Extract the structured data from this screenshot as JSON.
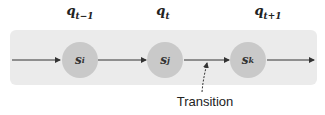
{
  "diagram": {
    "type": "state-sequence",
    "time_labels": [
      {
        "base": "q",
        "sub": "t−1"
      },
      {
        "base": "q",
        "sub": "t"
      },
      {
        "base": "q",
        "sub": "t+1"
      }
    ],
    "states": [
      {
        "base": "s",
        "sub": "i"
      },
      {
        "base": "s",
        "sub": "j"
      },
      {
        "base": "s",
        "sub": "k"
      }
    ],
    "annotation": "Transition",
    "colors": {
      "band": "#ebebeb",
      "state_fill": "#c9c9c9",
      "arrow": "#333333"
    }
  }
}
